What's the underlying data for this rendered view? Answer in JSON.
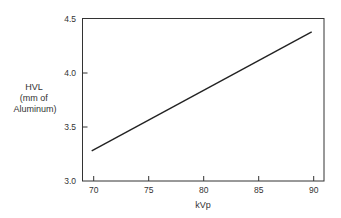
{
  "chart_data": {
    "type": "line",
    "title": "",
    "xlabel": "kVp",
    "ylabel_lines": [
      "HVL",
      "(mm of",
      "Aluminum)"
    ],
    "ylabel": "HVL (mm of Aluminum)",
    "xlim": [
      69,
      91
    ],
    "ylim": [
      3.0,
      4.5
    ],
    "x_ticks": [
      70,
      75,
      80,
      85,
      90
    ],
    "x_tick_labels": [
      "70",
      "75",
      "80",
      "85",
      "90"
    ],
    "y_ticks": [
      3.0,
      3.5,
      4.0,
      4.5
    ],
    "y_tick_labels": [
      "3.0",
      "3.5",
      "4.0",
      "4.5"
    ],
    "grid": false,
    "legend": null,
    "series": [
      {
        "name": "HVL vs kVp",
        "x": [
          70,
          90
        ],
        "y": [
          3.28,
          4.38
        ]
      }
    ]
  }
}
